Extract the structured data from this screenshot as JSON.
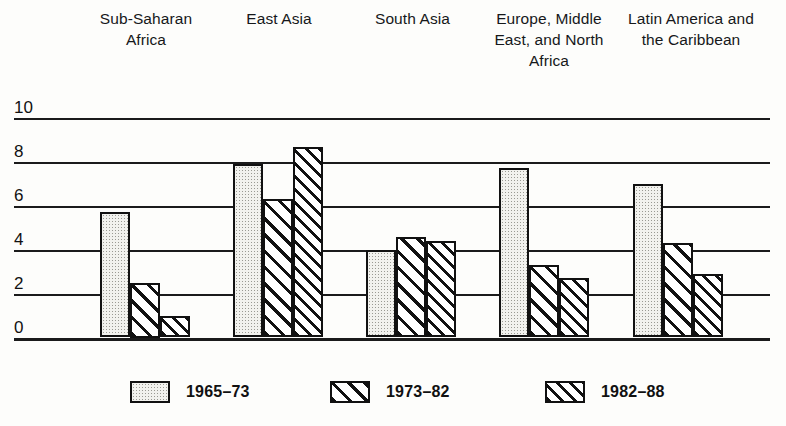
{
  "chart_data": {
    "type": "bar",
    "title": "",
    "xlabel": "",
    "ylabel": "",
    "ylim": [
      0,
      10
    ],
    "yticks": [
      0,
      2,
      4,
      6,
      8,
      10
    ],
    "grid": true,
    "legend_position": "bottom",
    "categories": [
      "Sub-Saharan Africa",
      "East Asia",
      "South Asia",
      "Europe, Middle East, and North Africa",
      "Latin America and the Caribbean"
    ],
    "series": [
      {
        "name": "1965–73",
        "values": [
          5.7,
          7.9,
          4.0,
          7.7,
          7.0
        ]
      },
      {
        "name": "1973–82",
        "values": [
          2.5,
          6.3,
          4.6,
          3.3,
          4.3
        ]
      },
      {
        "name": "1982–88",
        "values": [
          1.0,
          8.7,
          4.4,
          2.7,
          2.9
        ]
      }
    ]
  },
  "headers": [
    {
      "lines": [
        "Sub-Saharan",
        "Africa"
      ]
    },
    {
      "lines": [
        "East Asia"
      ]
    },
    {
      "lines": [
        "South Asia"
      ]
    },
    {
      "lines": [
        "Europe, Middle",
        "East, and North",
        "Africa"
      ]
    },
    {
      "lines": [
        "Latin America and",
        "the Caribbean"
      ]
    }
  ],
  "yticks": [
    "0",
    "2",
    "4",
    "6",
    "8",
    "10"
  ],
  "legend": [
    {
      "label": "1965–73",
      "pattern": "stipple"
    },
    {
      "label": "1973–82",
      "pattern": "hatch-wide"
    },
    {
      "label": "1982–88",
      "pattern": "hatch-dense"
    }
  ],
  "colors": {
    "ink": "#111111",
    "paper": "#fdfdfb",
    "stipple_fill": "#f2f2ee"
  }
}
